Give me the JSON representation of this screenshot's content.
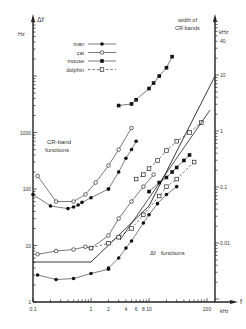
{
  "chart_data": {
    "type": "line",
    "title": "",
    "xlabel": "f",
    "xunit": "kHz",
    "x_scale": "log",
    "xlim": [
      0.1,
      100
    ],
    "x_ticks": [
      "0.1",
      "1",
      "2",
      "4",
      "6",
      "8",
      "10",
      "100"
    ],
    "left_axis": {
      "label": "Δf",
      "unit": "Hz",
      "scale": "log",
      "ylim": [
        1,
        20000
      ],
      "ticks": [
        "1",
        "10",
        "100",
        "1000"
      ]
    },
    "right_axis": {
      "label": "width of CR-bands",
      "unit": "kHz",
      "scale": "log",
      "ylim": [
        0.002,
        60
      ],
      "ticks": [
        "0.01",
        "0.1",
        "1",
        "10",
        "40"
      ]
    },
    "annotations": [
      "CR-band functions",
      "Δf functions"
    ],
    "legend": {
      "position": "upper-left",
      "entries": [
        {
          "name": "man",
          "marker": "filled-circle",
          "line": "solid"
        },
        {
          "name": "cat",
          "marker": "open-circle",
          "line": "solid"
        },
        {
          "name": "mouse",
          "marker": "filled-square",
          "line": "solid"
        },
        {
          "name": "dolphin",
          "marker": "open-square",
          "line": "dashed"
        }
      ]
    },
    "grid": false,
    "series": [
      {
        "name": "man CR-band",
        "group": "CR-band",
        "axis": "left",
        "marker": "filled-circle",
        "line": "solid",
        "x": [
          0.1,
          0.2,
          0.4,
          0.5,
          0.6,
          0.7,
          1,
          2
        ],
        "y": [
          80,
          50,
          45,
          48,
          52,
          58,
          70,
          100
        ]
      },
      {
        "name": "man CR-band (high)",
        "group": "CR-band",
        "axis": "left",
        "marker": "filled-circle",
        "line": "solid",
        "x": [
          2,
          3,
          4,
          5,
          6
        ],
        "y": [
          100,
          200,
          350,
          500,
          700
        ]
      },
      {
        "name": "cat CR-band",
        "group": "CR-band",
        "axis": "left",
        "marker": "open-circle",
        "line": "solid",
        "x": [
          0.12,
          0.25,
          0.5,
          0.8,
          1.2,
          2,
          3,
          5
        ],
        "y": [
          170,
          60,
          60,
          80,
          130,
          260,
          500,
          1200
        ]
      },
      {
        "name": "mouse CR-band",
        "group": "CR-band",
        "axis": "left",
        "marker": "filled-square",
        "line": "solid",
        "x": [
          3,
          5,
          6,
          10,
          12,
          15,
          20,
          25
        ],
        "y": [
          3000,
          3200,
          3800,
          6000,
          7500,
          10000,
          14000,
          22000
        ]
      },
      {
        "name": "dolphin CR-band",
        "group": "CR-band",
        "axis": "left",
        "marker": "open-square",
        "line": "dashed",
        "x": [
          6,
          8,
          10,
          14,
          20,
          30,
          50,
          80
        ],
        "y": [
          150,
          180,
          230,
          320,
          480,
          700,
          1000,
          1500
        ]
      },
      {
        "name": "reference CR-band width",
        "group": "CR-band",
        "axis": "right",
        "marker": "none",
        "line": "solid",
        "x": [
          0.1,
          1,
          10,
          100
        ],
        "y": [
          0.02,
          0.02,
          0.17,
          1.7
        ]
      },
      {
        "name": "man Δf",
        "group": "Δf",
        "axis": "left",
        "marker": "filled-circle",
        "line": "solid",
        "x": [
          0.12,
          0.25,
          0.5,
          1,
          2
        ],
        "y": [
          3,
          2.5,
          2.6,
          3.2,
          3.8
        ]
      },
      {
        "name": "man Δf (high)",
        "group": "Δf",
        "axis": "left",
        "marker": "filled-circle",
        "line": "solid",
        "x": [
          2,
          3,
          4,
          5,
          8,
          10,
          14,
          20,
          30
        ],
        "y": [
          4,
          6,
          9,
          12,
          25,
          35,
          55,
          80,
          110
        ]
      },
      {
        "name": "cat Δf",
        "group": "Δf",
        "axis": "left",
        "marker": "open-circle",
        "line": "solid",
        "x": [
          0.12,
          0.25,
          0.5,
          0.8,
          1,
          2,
          3,
          5,
          8,
          12
        ],
        "y": [
          7,
          8,
          8.5,
          9.5,
          9,
          15,
          30,
          60,
          110,
          180
        ]
      },
      {
        "name": "mouse Δf",
        "group": "Δf",
        "axis": "left",
        "marker": "filled-square",
        "line": "solid",
        "x": [
          10,
          15,
          20,
          25,
          30,
          40,
          50
        ],
        "y": [
          90,
          130,
          160,
          200,
          240,
          320,
          400
        ]
      },
      {
        "name": "dolphin Δf",
        "group": "Δf",
        "axis": "left",
        "marker": "open-square",
        "line": "dashed",
        "x": [
          1,
          2,
          3,
          5,
          8,
          15,
          20,
          30,
          60
        ],
        "y": [
          9,
          11,
          14,
          20,
          35,
          75,
          110,
          150,
          300
        ]
      }
    ]
  },
  "labels": {
    "left_axis_title": "Δf",
    "left_axis_unit": "Hz",
    "right_axis_title_line1": "width of",
    "right_axis_title_line2": "CR-bands",
    "right_axis_unit": "kHz",
    "x_axis_title": "f",
    "x_axis_unit": "kHz",
    "cr_annotation_line1": "CR-band",
    "cr_annotation_line2": "functions",
    "df_annotation": "Δf   functions"
  }
}
